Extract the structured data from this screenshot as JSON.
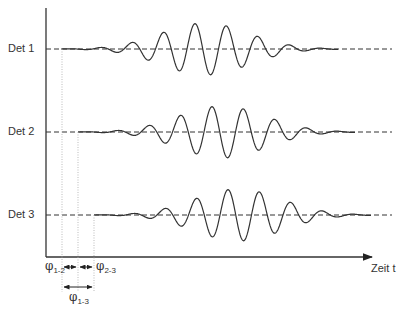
{
  "diagram": {
    "type": "waveform-timing",
    "axis": {
      "x_label": "Zeit t"
    },
    "detectors": [
      {
        "label": "Det 1",
        "baseline_y": 49,
        "start_x": 61
      },
      {
        "label": "Det 2",
        "baseline_y": 132,
        "start_x": 78
      },
      {
        "label": "Det 3",
        "baseline_y": 215,
        "start_x": 94
      }
    ],
    "phase_labels": {
      "p12": {
        "symbol": "φ",
        "sub": "1-2"
      },
      "p23": {
        "symbol": "φ",
        "sub": "2-3"
      },
      "p13": {
        "symbol": "φ",
        "sub": "1-3"
      }
    },
    "colors": {
      "line": "#333333",
      "dotted": "#aaaaaa"
    }
  }
}
